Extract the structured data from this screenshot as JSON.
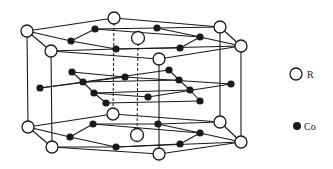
{
  "figure": {
    "colors": {
      "line": "#1a1a1a",
      "r_fill": "#ffffff",
      "co_fill": "#1a1a1a",
      "background": "#ffffff"
    }
  },
  "legend": {
    "items": [
      {
        "symbol": "open-circle",
        "label": "R"
      },
      {
        "symbol": "filled-circle",
        "label": "Co"
      }
    ]
  },
  "atoms": {
    "top_layer": {
      "R": [
        [
          27,
          31
        ],
        [
          114,
          18
        ],
        [
          220,
          27
        ],
        [
          241,
          46
        ],
        [
          159,
          59
        ],
        [
          51,
          51
        ]
      ],
      "R_center": [
        138,
        38
      ],
      "Co": [
        [
          95,
          29
        ],
        [
          71,
          41
        ],
        [
          116,
          49
        ],
        [
          157,
          28
        ],
        [
          200,
          37
        ],
        [
          180,
          48
        ]
      ]
    },
    "middle_layer": {
      "Co": [
        [
          40,
          88
        ],
        [
          72,
          72
        ],
        [
          83,
          82
        ],
        [
          94,
          93
        ],
        [
          106,
          103
        ],
        [
          125,
          77
        ],
        [
          148,
          97
        ],
        [
          169,
          70
        ],
        [
          179,
          80
        ],
        [
          190,
          90
        ],
        [
          200,
          101
        ],
        [
          231,
          84
        ]
      ]
    },
    "bottom_layer": {
      "R": [
        [
          28,
          127
        ],
        [
          113,
          114
        ],
        [
          220,
          122
        ],
        [
          241,
          142
        ],
        [
          159,
          154
        ],
        [
          52,
          147
        ]
      ],
      "R_center": [
        137,
        135
      ],
      "Co": [
        [
          93,
          124
        ],
        [
          70,
          137
        ],
        [
          116,
          147
        ],
        [
          158,
          124
        ],
        [
          200,
          133
        ],
        [
          180,
          144
        ]
      ]
    }
  }
}
